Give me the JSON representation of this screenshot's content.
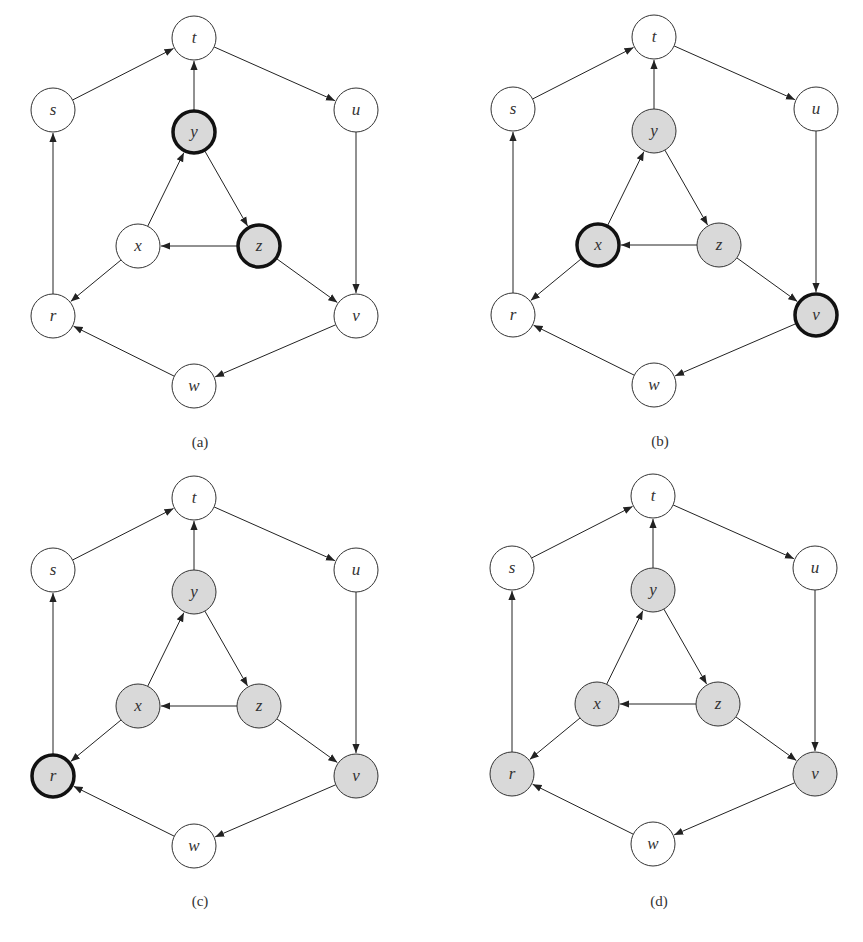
{
  "figure": {
    "colors": {
      "edge": "#222222",
      "node_border": "#333333",
      "node_fill_default": "#ffffff",
      "node_fill_visited": "#d9d9d9",
      "current_border": "#111111"
    },
    "nodes": [
      {
        "id": "t",
        "x": 194,
        "y": 38
      },
      {
        "id": "s",
        "x": 53,
        "y": 110
      },
      {
        "id": "u",
        "x": 356,
        "y": 110
      },
      {
        "id": "y",
        "x": 194,
        "y": 132
      },
      {
        "id": "x",
        "x": 138,
        "y": 246
      },
      {
        "id": "z",
        "x": 259,
        "y": 246
      },
      {
        "id": "r",
        "x": 53,
        "y": 316
      },
      {
        "id": "v",
        "x": 356,
        "y": 316
      },
      {
        "id": "w",
        "x": 194,
        "y": 386
      }
    ],
    "edges": [
      [
        "s",
        "t"
      ],
      [
        "t",
        "u"
      ],
      [
        "y",
        "t"
      ],
      [
        "u",
        "v"
      ],
      [
        "y",
        "z"
      ],
      [
        "x",
        "y"
      ],
      [
        "z",
        "x"
      ],
      [
        "z",
        "v"
      ],
      [
        "x",
        "r"
      ],
      [
        "r",
        "s"
      ],
      [
        "v",
        "w"
      ],
      [
        "w",
        "r"
      ]
    ],
    "panels": [
      {
        "caption": "(a)",
        "dx": 0,
        "dy": 0,
        "visited": [
          "y",
          "z"
        ],
        "current": [
          "y",
          "z"
        ]
      },
      {
        "caption": "(b)",
        "dx": 460,
        "dy": -1,
        "visited": [
          "y",
          "z",
          "x",
          "v"
        ],
        "current": [
          "x",
          "v"
        ]
      },
      {
        "caption": "(c)",
        "dx": 0,
        "dy": 460,
        "visited": [
          "y",
          "z",
          "x",
          "v",
          "r"
        ],
        "current": [
          "r"
        ]
      },
      {
        "caption": "(d)",
        "dx": 459,
        "dy": 458,
        "visited": [
          "y",
          "z",
          "x",
          "v",
          "r"
        ],
        "current": []
      }
    ]
  }
}
